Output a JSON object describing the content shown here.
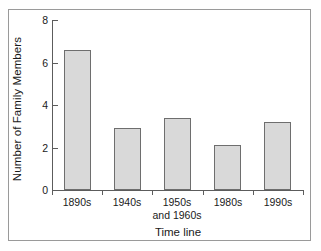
{
  "chart_data": {
    "type": "bar",
    "title": "",
    "xlabel": "Time line",
    "ylabel": "Number of Family Members",
    "categories": [
      "1890s",
      "1940s",
      "1950s",
      "1980s",
      "1990s"
    ],
    "category_sublabels": [
      "",
      "",
      "and 1960s",
      "",
      ""
    ],
    "values": [
      6.6,
      2.9,
      3.4,
      2.1,
      3.2
    ],
    "ylim": [
      0,
      8
    ],
    "yticks": [
      0,
      2,
      4,
      6,
      8
    ],
    "ytick_labels": [
      "0",
      "2",
      "4",
      "6",
      "8"
    ],
    "grid": false,
    "legend": false,
    "legend_position": "none",
    "colors": {
      "bar_fill": "#d9d9d9",
      "bar_edge": "#6e6e6e",
      "axis": "#5c5c5c",
      "frame": "#9a9a9a",
      "text": "#1a1a1a",
      "background": "#ffffff"
    }
  }
}
